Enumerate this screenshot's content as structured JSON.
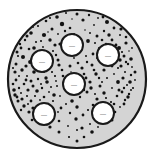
{
  "figure": {
    "name": "speckled-circular-specimen-diagram",
    "canvas": {
      "width": 154,
      "height": 159,
      "background": "#ffffff"
    }
  },
  "specimen": {
    "shape": "circle",
    "center": {
      "x": 77,
      "y": 79
    },
    "radius": 69,
    "fill_color": "#d4d4d4",
    "outline_color": "#1a1a1a",
    "outline_width": 2.2
  },
  "speckles": {
    "color": "#111111",
    "count": 236,
    "min_radius": 0.7,
    "max_radius": 2.6,
    "points": [
      [
        77,
        14,
        1.5
      ],
      [
        66,
        13,
        1.0
      ],
      [
        89,
        15,
        1.2
      ],
      [
        57,
        17,
        1.8
      ],
      [
        98,
        18,
        0.9
      ],
      [
        46,
        21,
        1.3
      ],
      [
        107,
        22,
        2.0
      ],
      [
        72,
        19,
        0.8
      ],
      [
        83,
        20,
        1.6
      ],
      [
        38,
        26,
        1.1
      ],
      [
        114,
        28,
        1.4
      ],
      [
        62,
        24,
        2.2
      ],
      [
        94,
        25,
        0.9
      ],
      [
        52,
        29,
        1.5
      ],
      [
        104,
        31,
        1.2
      ],
      [
        31,
        33,
        1.8
      ],
      [
        120,
        35,
        1.0
      ],
      [
        70,
        28,
        1.3
      ],
      [
        85,
        30,
        0.8
      ],
      [
        44,
        35,
        2.1
      ],
      [
        112,
        40,
        1.4
      ],
      [
        25,
        40,
        1.2
      ],
      [
        126,
        43,
        1.6
      ],
      [
        58,
        34,
        0.9
      ],
      [
        97,
        36,
        1.5
      ],
      [
        36,
        42,
        1.1
      ],
      [
        119,
        48,
        2.0
      ],
      [
        21,
        48,
        1.4
      ],
      [
        129,
        51,
        0.8
      ],
      [
        50,
        40,
        1.7
      ],
      [
        106,
        44,
        1.2
      ],
      [
        67,
        38,
        1.0
      ],
      [
        88,
        41,
        1.9
      ],
      [
        29,
        49,
        1.3
      ],
      [
        124,
        56,
        1.5
      ],
      [
        18,
        56,
        1.1
      ],
      [
        131,
        59,
        1.8
      ],
      [
        43,
        47,
        0.9
      ],
      [
        113,
        52,
        1.4
      ],
      [
        60,
        44,
        1.6
      ],
      [
        99,
        48,
        1.0
      ],
      [
        23,
        57,
        2.0
      ],
      [
        128,
        64,
        1.2
      ],
      [
        16,
        64,
        1.5
      ],
      [
        132,
        67,
        0.9
      ],
      [
        37,
        55,
        1.3
      ],
      [
        120,
        60,
        1.7
      ],
      [
        53,
        51,
        1.1
      ],
      [
        93,
        54,
        1.4
      ],
      [
        30,
        62,
        1.9
      ],
      [
        125,
        72,
        1.0
      ],
      [
        15,
        72,
        1.6
      ],
      [
        131,
        75,
        1.2
      ],
      [
        47,
        58,
        0.8
      ],
      [
        107,
        58,
        1.5
      ],
      [
        66,
        52,
        1.3
      ],
      [
        86,
        56,
        1.0
      ],
      [
        22,
        70,
        1.7
      ],
      [
        118,
        68,
        1.1
      ],
      [
        16,
        80,
        1.4
      ],
      [
        130,
        82,
        1.8
      ],
      [
        40,
        65,
        1.2
      ],
      [
        100,
        62,
        0.9
      ],
      [
        58,
        60,
        1.5
      ],
      [
        78,
        63,
        1.3
      ],
      [
        27,
        76,
        1.0
      ],
      [
        123,
        78,
        1.6
      ],
      [
        19,
        88,
        1.2
      ],
      [
        133,
        88,
        1.1
      ],
      [
        34,
        72,
        1.8
      ],
      [
        112,
        66,
        1.4
      ],
      [
        51,
        66,
        0.9
      ],
      [
        92,
        65,
        1.5
      ],
      [
        24,
        84,
        1.3
      ],
      [
        127,
        85,
        1.0
      ],
      [
        15,
        95,
        1.7
      ],
      [
        129,
        94,
        1.2
      ],
      [
        44,
        72,
        1.1
      ],
      [
        104,
        70,
        1.6
      ],
      [
        62,
        70,
        1.3
      ],
      [
        71,
        72,
        0.8
      ],
      [
        31,
        81,
        1.5
      ],
      [
        118,
        82,
        1.9
      ],
      [
        21,
        93,
        1.0
      ],
      [
        122,
        92,
        1.4
      ],
      [
        38,
        79,
        1.2
      ],
      [
        96,
        74,
        1.7
      ],
      [
        55,
        76,
        1.1
      ],
      [
        84,
        74,
        1.3
      ],
      [
        28,
        90,
        1.6
      ],
      [
        112,
        88,
        0.9
      ],
      [
        18,
        101,
        1.5
      ],
      [
        125,
        100,
        1.2
      ],
      [
        47,
        82,
        1.8
      ],
      [
        107,
        78,
        1.0
      ],
      [
        65,
        81,
        1.4
      ],
      [
        90,
        82,
        1.6
      ],
      [
        35,
        96,
        1.1
      ],
      [
        117,
        96,
        1.3
      ],
      [
        24,
        106,
        1.7
      ],
      [
        120,
        107,
        0.9
      ],
      [
        42,
        88,
        1.2
      ],
      [
        100,
        86,
        1.5
      ],
      [
        57,
        86,
        1.0
      ],
      [
        78,
        87,
        1.8
      ],
      [
        31,
        101,
        1.4
      ],
      [
        111,
        102,
        1.1
      ],
      [
        29,
        112,
        1.6
      ],
      [
        115,
        112,
        1.3
      ],
      [
        49,
        92,
        0.9
      ],
      [
        104,
        93,
        1.7
      ],
      [
        68,
        91,
        1.2
      ],
      [
        87,
        92,
        1.5
      ],
      [
        38,
        106,
        1.0
      ],
      [
        108,
        108,
        1.4
      ],
      [
        35,
        117,
        1.8
      ],
      [
        110,
        117,
        1.1
      ],
      [
        44,
        97,
        1.3
      ],
      [
        97,
        99,
        1.6
      ],
      [
        60,
        96,
        0.9
      ],
      [
        80,
        97,
        1.2
      ],
      [
        45,
        111,
        1.5
      ],
      [
        101,
        114,
        1.0
      ],
      [
        42,
        122,
        1.7
      ],
      [
        104,
        122,
        1.4
      ],
      [
        53,
        101,
        1.1
      ],
      [
        93,
        105,
        1.3
      ],
      [
        72,
        101,
        1.8
      ],
      [
        66,
        104,
        1.0
      ],
      [
        52,
        116,
        1.5
      ],
      [
        96,
        119,
        1.2
      ],
      [
        50,
        127,
        1.6
      ],
      [
        98,
        127,
        0.9
      ],
      [
        61,
        108,
        1.4
      ],
      [
        88,
        110,
        1.1
      ],
      [
        77,
        107,
        1.7
      ],
      [
        59,
        121,
        1.3
      ],
      [
        90,
        124,
        1.0
      ],
      [
        59,
        132,
        1.5
      ],
      [
        92,
        132,
        1.8
      ],
      [
        70,
        113,
        1.2
      ],
      [
        83,
        115,
        1.4
      ],
      [
        68,
        126,
        0.9
      ],
      [
        82,
        128,
        1.6
      ],
      [
        69,
        137,
        1.1
      ],
      [
        84,
        137,
        1.3
      ],
      [
        76,
        119,
        1.7
      ],
      [
        77,
        130,
        1.0
      ],
      [
        77,
        141,
        1.5
      ],
      [
        50,
        18,
        1.1
      ],
      [
        103,
        17,
        1.4
      ],
      [
        33,
        27,
        0.9
      ],
      [
        121,
        29,
        1.6
      ],
      [
        65,
        31,
        1.2
      ],
      [
        90,
        33,
        1.0
      ],
      [
        27,
        36,
        1.5
      ],
      [
        126,
        37,
        1.3
      ],
      [
        48,
        32,
        0.8
      ],
      [
        109,
        35,
        1.7
      ],
      [
        41,
        41,
        1.1
      ],
      [
        116,
        45,
        1.4
      ],
      [
        20,
        44,
        1.2
      ],
      [
        132,
        48,
        0.9
      ],
      [
        55,
        45,
        1.6
      ],
      [
        102,
        40,
        1.3
      ],
      [
        74,
        34,
        1.0
      ],
      [
        34,
        48,
        1.8
      ],
      [
        122,
        52,
        1.1
      ],
      [
        17,
        52,
        1.5
      ],
      [
        126,
        62,
        1.2
      ],
      [
        46,
        53,
        0.9
      ],
      [
        110,
        50,
        1.7
      ],
      [
        63,
        48,
        1.4
      ],
      [
        95,
        43,
        1.0
      ],
      [
        26,
        66,
        1.6
      ],
      [
        116,
        58,
        1.3
      ],
      [
        13,
        68,
        1.1
      ],
      [
        135,
        72,
        1.5
      ],
      [
        42,
        60,
        0.8
      ],
      [
        103,
        54,
        1.8
      ],
      [
        56,
        55,
        1.2
      ],
      [
        81,
        50,
        1.4
      ],
      [
        19,
        76,
        1.0
      ],
      [
        121,
        66,
        1.6
      ],
      [
        13,
        84,
        1.3
      ],
      [
        135,
        80,
        0.9
      ],
      [
        36,
        68,
        1.7
      ],
      [
        97,
        58,
        1.1
      ],
      [
        50,
        62,
        1.5
      ],
      [
        87,
        62,
        1.2
      ],
      [
        26,
        80,
        1.4
      ],
      [
        131,
        90,
        1.0
      ],
      [
        14,
        90,
        1.8
      ],
      [
        44,
        68,
        1.3
      ],
      [
        110,
        62,
        1.1
      ],
      [
        59,
        65,
        1.6
      ],
      [
        74,
        58,
        0.9
      ],
      [
        33,
        86,
        1.5
      ],
      [
        124,
        88,
        1.2
      ],
      [
        17,
        97,
        1.4
      ],
      [
        128,
        97,
        1.7
      ],
      [
        41,
        84,
        1.0
      ],
      [
        94,
        70,
        1.3
      ],
      [
        52,
        72,
        1.1
      ],
      [
        70,
        66,
        1.5
      ],
      [
        22,
        99,
        1.6
      ],
      [
        114,
        74,
        0.9
      ],
      [
        21,
        110,
        1.2
      ],
      [
        124,
        104,
        1.4
      ],
      [
        37,
        91,
        1.8
      ],
      [
        102,
        82,
        1.0
      ],
      [
        63,
        76,
        1.3
      ],
      [
        82,
        68,
        1.6
      ],
      [
        27,
        96,
        1.1
      ],
      [
        119,
        90,
        1.5
      ],
      [
        28,
        104,
        1.0
      ],
      [
        114,
        104,
        1.3
      ],
      [
        46,
        78,
        1.7
      ],
      [
        99,
        78,
        1.2
      ],
      [
        56,
        81,
        0.9
      ],
      [
        75,
        78,
        1.4
      ],
      [
        33,
        108,
        1.6
      ],
      [
        106,
        98,
        1.1
      ],
      [
        32,
        120,
        1.3
      ],
      [
        112,
        120,
        1.5
      ],
      [
        51,
        87,
        1.0
      ],
      [
        91,
        88,
        1.7
      ],
      [
        64,
        86,
        1.2
      ],
      [
        86,
        78,
        1.4
      ],
      [
        40,
        100,
        0.9
      ],
      [
        103,
        104,
        1.6
      ],
      [
        38,
        113,
        1.1
      ],
      [
        107,
        112,
        1.3
      ],
      [
        48,
        104,
        1.5
      ],
      [
        95,
        94,
        1.0
      ],
      [
        54,
        95,
        1.8
      ],
      [
        84,
        90,
        1.2
      ],
      [
        46,
        118,
        1.4
      ],
      [
        100,
        108,
        1.1
      ],
      [
        47,
        124,
        1.6
      ],
      [
        58,
        112,
        0.9
      ]
    ]
  },
  "markers": {
    "fill_color": "#ffffff",
    "outline_color": "#1a1a1a",
    "outline_width": 2.0,
    "radius": 11,
    "dash_color": "#4a4a4a",
    "dash_label": "—",
    "items": [
      {
        "id": "marker-top-center",
        "cx": 72,
        "cy": 45,
        "label": "—"
      },
      {
        "id": "marker-upper-left",
        "cx": 42,
        "cy": 61,
        "label": "—"
      },
      {
        "id": "marker-upper-right",
        "cx": 108,
        "cy": 55,
        "label": "—"
      },
      {
        "id": "marker-center",
        "cx": 74,
        "cy": 84,
        "label": "—"
      },
      {
        "id": "marker-lower-left",
        "cx": 44,
        "cy": 114,
        "label": "—"
      },
      {
        "id": "marker-lower-right",
        "cx": 103,
        "cy": 113,
        "label": "—"
      }
    ]
  }
}
